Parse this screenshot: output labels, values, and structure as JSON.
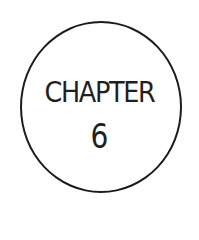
{
  "badge": {
    "label": "CHAPTER",
    "number": "6",
    "stroke_color": "#1c1c1c",
    "text_color": "#1f1f1f",
    "background": "#ffffff"
  }
}
